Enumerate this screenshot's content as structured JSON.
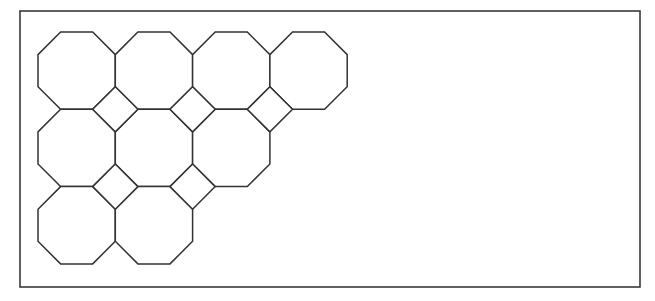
{
  "diagram": {
    "type": "truncated-square-tiling-fragment",
    "frame": {
      "x": 20,
      "y": 11,
      "width": 620,
      "height": 276
    },
    "grid": {
      "origin_x": 38,
      "origin_y": 32,
      "pitch": 77.3,
      "octagon_size": 77.3,
      "corner_cut": 22.6
    },
    "stroke_color": "#333333",
    "fill_color": "#ffffff",
    "octagons": [
      {
        "row": 0,
        "col": 0
      },
      {
        "row": 0,
        "col": 1
      },
      {
        "row": 0,
        "col": 2
      },
      {
        "row": 0,
        "col": 3
      },
      {
        "row": 1,
        "col": 0
      },
      {
        "row": 1,
        "col": 1
      },
      {
        "row": 1,
        "col": 2
      },
      {
        "row": 2,
        "col": 0
      },
      {
        "row": 2,
        "col": 1
      }
    ],
    "squares": [
      {
        "row": 1,
        "col": 1
      },
      {
        "row": 1,
        "col": 2
      },
      {
        "row": 1,
        "col": 3
      },
      {
        "row": 2,
        "col": 1
      },
      {
        "row": 2,
        "col": 2
      }
    ],
    "counts": {
      "octagons": 9,
      "squares": 5
    }
  }
}
